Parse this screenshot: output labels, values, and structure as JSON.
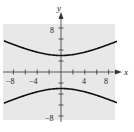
{
  "chart_data": {
    "type": "line",
    "title": "",
    "xlabel": "x",
    "ylabel": "y",
    "xlim": [
      -9.8,
      9.5
    ],
    "ylim": [
      -10,
      10
    ],
    "grid": false,
    "background": "#e8e8e8",
    "curve_color": "#111111",
    "equation": "y^2/9 - x^2/36 = 1",
    "x_ticks": [
      -8,
      -6,
      -4,
      -2,
      2,
      4,
      6,
      8
    ],
    "x_tick_labels": [
      "-8",
      "-4",
      "4",
      "8"
    ],
    "y_ticks": [
      -8,
      -6,
      -4,
      -2,
      2,
      4,
      6,
      8
    ],
    "y_tick_labels": [
      "8",
      "-8"
    ],
    "series": [
      {
        "name": "upper branch",
        "x": [
          -9.5,
          -8,
          -6,
          -4,
          -2,
          0,
          2,
          4,
          6,
          8,
          9.5
        ],
        "y": [
          5.6,
          5.0,
          4.24,
          3.61,
          3.16,
          3.0,
          3.16,
          3.61,
          4.24,
          5.0,
          5.6
        ]
      },
      {
        "name": "lower branch",
        "x": [
          -9.5,
          -8,
          -6,
          -4,
          -2,
          0,
          2,
          4,
          6,
          8,
          9.5
        ],
        "y": [
          -5.6,
          -5.0,
          -4.24,
          -3.61,
          -3.16,
          -3.0,
          -3.16,
          -3.61,
          -4.24,
          -5.0,
          -5.6
        ]
      }
    ]
  },
  "labels": {
    "x_axis": "x",
    "y_axis": "y",
    "xneg8": "−8",
    "xneg4": "−4",
    "x4": "4",
    "x8": "8",
    "y8": "8",
    "yneg8": "−8"
  }
}
